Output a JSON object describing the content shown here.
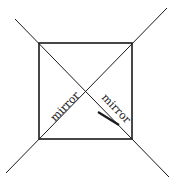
{
  "diagram": {
    "type": "square with two crossing diagonal mirrors",
    "labels": {
      "left_mirror": "mirror",
      "right_mirror": "mirror"
    },
    "colors": {
      "stroke": "#1a1a1a",
      "background": "#ffffff"
    }
  }
}
